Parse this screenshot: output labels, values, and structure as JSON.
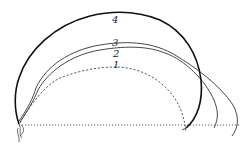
{
  "diagram": {
    "type": "trajectory-curves",
    "baseline": {
      "style": "dotted",
      "y": 124,
      "x_start": 19,
      "x_end": 240
    },
    "curves": [
      {
        "label": "1",
        "style": "dashed",
        "weight": "thin"
      },
      {
        "label": "2",
        "style": "solid",
        "weight": "thin"
      },
      {
        "label": "3",
        "style": "solid",
        "weight": "thin"
      },
      {
        "label": "4",
        "style": "solid",
        "weight": "thick"
      }
    ],
    "colors": {
      "ink": "#222222",
      "background": "#ffffff"
    }
  }
}
